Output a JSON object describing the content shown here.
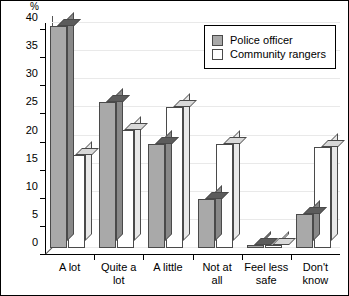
{
  "chart_data": {
    "type": "bar",
    "title": "",
    "xlabel": "",
    "ylabel": "%",
    "ylim": [
      0,
      40
    ],
    "yticks": [
      0,
      5,
      10,
      15,
      20,
      25,
      30,
      35,
      40
    ],
    "ytick_labels": [
      "0",
      "5",
      "10",
      "15",
      "20",
      "25",
      "30",
      "35",
      "40"
    ],
    "grid": true,
    "legend_position": "upper-right",
    "categories": [
      "A lot",
      "Quite a\nlot",
      "A little",
      "Not at\nall",
      "Feel less\nsafe",
      "Don't\nknow"
    ],
    "series": [
      {
        "name": "Police officer",
        "color": "#a9a9a9",
        "values": [
          39.5,
          26,
          18.5,
          8.7,
          0.5,
          6
        ]
      },
      {
        "name": "Community rangers",
        "color": "#ffffff",
        "values": [
          16.5,
          21,
          25,
          18.5,
          0.5,
          18
        ]
      }
    ]
  },
  "legend": {
    "items": [
      {
        "label": "Police officer",
        "swatch": "police"
      },
      {
        "label": "Community rangers",
        "swatch": "rangers"
      }
    ]
  }
}
